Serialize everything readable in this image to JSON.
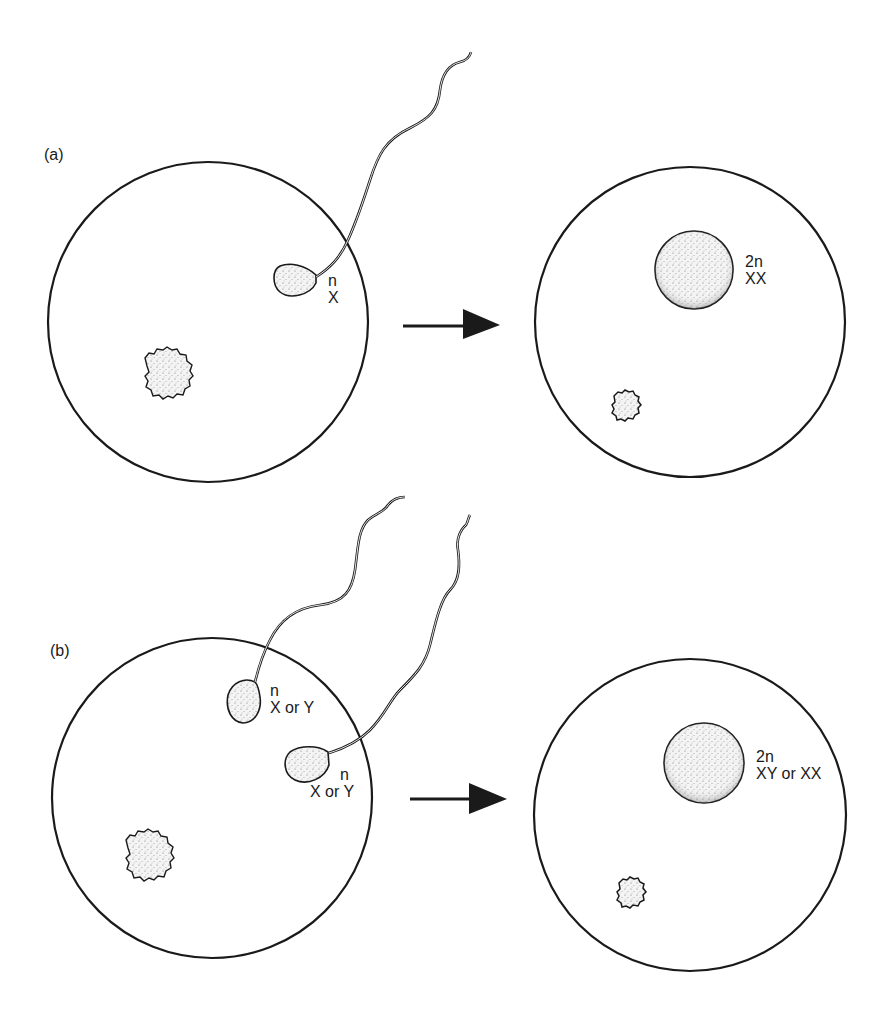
{
  "panels": [
    {
      "id": "a",
      "label": "(a)",
      "before": {
        "sperm": [
          {
            "ploidy": "n",
            "chromosome": "X"
          }
        ]
      },
      "after": {
        "ploidy": "2n",
        "chromosome": "XX"
      }
    },
    {
      "id": "b",
      "label": "(b)",
      "before": {
        "sperm": [
          {
            "ploidy": "n",
            "chromosome": "X or Y"
          },
          {
            "ploidy": "n",
            "chromosome": "X or Y"
          }
        ]
      },
      "after": {
        "ploidy": "2n",
        "chromosome": "XY or XX"
      }
    }
  ],
  "colors": {
    "stroke": "#1a1a1a",
    "background": "#ffffff",
    "stipple": "#8a8a8a"
  }
}
